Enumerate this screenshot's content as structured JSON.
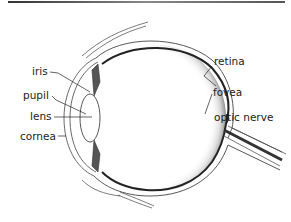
{
  "diagram": {
    "labels": {
      "iris": "iris",
      "pupil": "pupil",
      "lens": "lens",
      "cornea": "cornea",
      "retina": "retina",
      "fovea": "fovea",
      "optic_nerve": "optic nerve"
    },
    "colors": {
      "line": "#333333",
      "retina": "#222222",
      "shading": "#999999",
      "top_rule": "#555555",
      "background": "#ffffff"
    }
  }
}
